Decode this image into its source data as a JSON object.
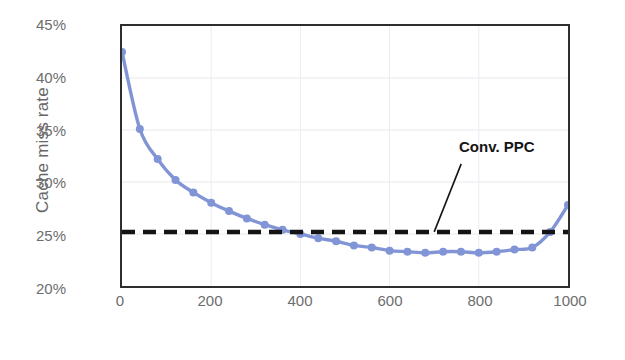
{
  "chart_data": {
    "type": "line",
    "title": "",
    "xlabel": "The number of entries in HTTP range",
    "ylabel": "Cache miss rate",
    "xlim": [
      0,
      1000
    ],
    "ylim": [
      20,
      45
    ],
    "grid": true,
    "legend_position": "none",
    "xticks": [
      "0",
      "200",
      "400",
      "600",
      "800",
      "1000"
    ],
    "xtick_values": [
      0,
      200,
      400,
      600,
      800,
      1000
    ],
    "yticks": [
      "20%",
      "25%",
      "30%",
      "35%",
      "40%",
      "45%"
    ],
    "ytick_values": [
      20,
      25,
      30,
      35,
      40,
      45
    ],
    "series": [
      {
        "name": "Proposed",
        "color": "#8195d6",
        "marker": "circle",
        "x": [
          0,
          40,
          80,
          120,
          160,
          200,
          240,
          280,
          320,
          360,
          400,
          440,
          480,
          520,
          560,
          600,
          640,
          680,
          720,
          760,
          800,
          840,
          880,
          920,
          960,
          1000
        ],
        "values": [
          42.5,
          35.1,
          32.2,
          30.2,
          29.0,
          28.0,
          27.2,
          26.5,
          25.9,
          25.4,
          25.0,
          24.6,
          24.3,
          23.9,
          23.7,
          23.4,
          23.3,
          23.2,
          23.3,
          23.3,
          23.2,
          23.3,
          23.5,
          23.7,
          25.2,
          27.8
        ]
      },
      {
        "name": "Conv. PPC",
        "color": "#141414",
        "style": "dashed",
        "constant_value": 25.2,
        "x": [
          0,
          1000
        ],
        "values": [
          25.2,
          25.2
        ]
      }
    ],
    "annotations": [
      {
        "text": "Conv. PPC",
        "target_x": 700,
        "target_y": 25.2
      }
    ]
  }
}
